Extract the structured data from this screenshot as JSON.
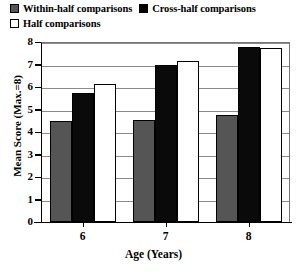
{
  "legend": {
    "items": [
      {
        "label": "Within-half comparisons",
        "swatch": "#555555",
        "key": "within"
      },
      {
        "label": "Cross-half comparisons",
        "swatch": "#000000",
        "key": "cross"
      },
      {
        "label": "Half comparisons",
        "swatch": "#ffffff",
        "key": "half"
      }
    ]
  },
  "axes": {
    "y_title": "Mean Score (Max.=8)",
    "x_title": "Age (Years)",
    "y_ticks": [
      "0",
      "1",
      "2",
      "3",
      "4",
      "5",
      "6",
      "7",
      "8"
    ],
    "x_ticks": [
      "6",
      "7",
      "8"
    ]
  },
  "chart_data": {
    "type": "bar",
    "title": "",
    "xlabel": "Age (Years)",
    "ylabel": "Mean Score (Max.=8)",
    "ylim": [
      0,
      8
    ],
    "yticks": [
      0,
      1,
      2,
      3,
      4,
      5,
      6,
      7,
      8
    ],
    "grid": true,
    "legend_position": "top-left",
    "categories": [
      "6",
      "7",
      "8"
    ],
    "series": [
      {
        "name": "Within-half comparisons",
        "color": "#555555",
        "values": [
          4.5,
          4.55,
          4.75
        ]
      },
      {
        "name": "Cross-half comparisons",
        "color": "#000000",
        "values": [
          5.75,
          7.0,
          7.8
        ]
      },
      {
        "name": "Half comparisons",
        "color": "#ffffff",
        "values": [
          6.15,
          7.15,
          7.75
        ]
      }
    ]
  }
}
